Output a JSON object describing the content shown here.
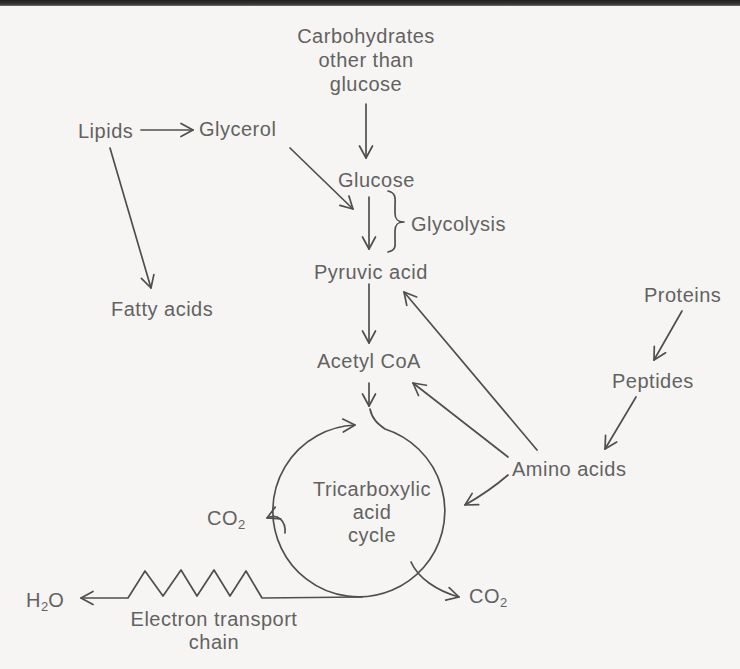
{
  "page": {
    "background": "#f6f5f3",
    "edge_band_color": "#343230",
    "ink_color": "#4f4f4f",
    "text_color": "#626262"
  },
  "nodes": {
    "carbohydrates": {
      "lines": [
        "Carbohydrates",
        "other than",
        "glucose"
      ]
    },
    "lipids": {
      "label": "Lipids"
    },
    "glycerol": {
      "label": "Glycerol"
    },
    "glucose": {
      "label": "Glucose"
    },
    "glycolysis": {
      "label": "Glycolysis"
    },
    "pyruvic_acid": {
      "label": "Pyruvic acid"
    },
    "fatty_acids": {
      "label": "Fatty acids"
    },
    "acetyl_coa": {
      "label": "Acetyl CoA"
    },
    "proteins": {
      "label": "Proteins"
    },
    "peptides": {
      "label": "Peptides"
    },
    "amino_acids": {
      "label": "Amino acids"
    },
    "tca_cycle": {
      "lines": [
        "Tricarboxylic",
        "acid",
        "cycle"
      ]
    },
    "co2_left": {
      "base": "CO",
      "sub": "2"
    },
    "co2_right": {
      "base": "CO",
      "sub": "2"
    },
    "h2o": {
      "base": "H",
      "sub": "2",
      "tail": "O"
    },
    "electron_transport_chain": {
      "lines": [
        "Electron transport",
        "chain"
      ]
    }
  },
  "connections": [
    {
      "from": "Carbohydrates other than glucose",
      "to": "Glucose"
    },
    {
      "from": "Lipids",
      "to": "Glycerol"
    },
    {
      "from": "Lipids",
      "to": "Fatty acids"
    },
    {
      "from": "Glycerol",
      "to": "Glycolysis pathway"
    },
    {
      "from": "Glucose",
      "to": "Pyruvic acid",
      "via": "Glycolysis"
    },
    {
      "from": "Fatty acids",
      "to": "Acetyl CoA"
    },
    {
      "from": "Pyruvic acid",
      "to": "Acetyl CoA"
    },
    {
      "from": "Acetyl CoA",
      "to": "Tricarboxylic acid cycle"
    },
    {
      "from": "Proteins",
      "to": "Peptides"
    },
    {
      "from": "Peptides",
      "to": "Amino acids"
    },
    {
      "from": "Amino acids",
      "to": "Pyruvic acid"
    },
    {
      "from": "Amino acids",
      "to": "Acetyl CoA"
    },
    {
      "from": "Amino acids",
      "to": "Tricarboxylic acid cycle"
    },
    {
      "from": "Tricarboxylic acid cycle",
      "to": "CO2 (left)"
    },
    {
      "from": "Tricarboxylic acid cycle",
      "to": "CO2 (right)"
    },
    {
      "from": "Tricarboxylic acid cycle",
      "to": "H2O",
      "via": "Electron transport chain"
    }
  ]
}
